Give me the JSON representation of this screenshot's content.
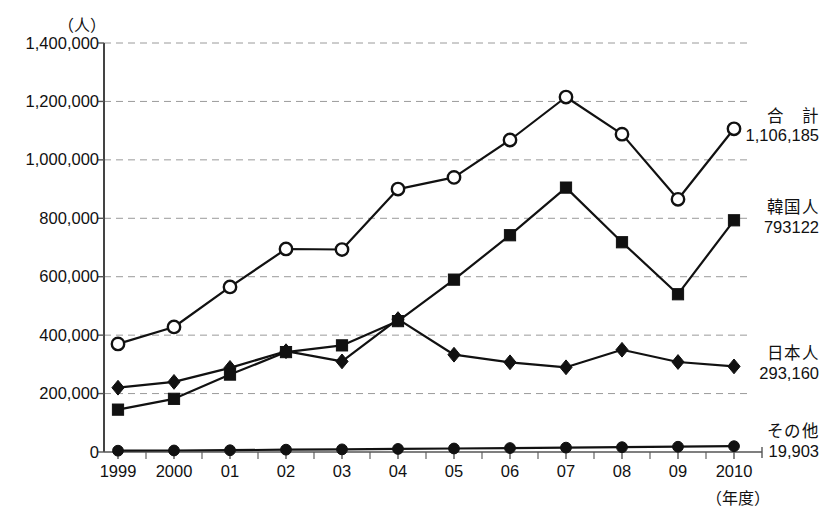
{
  "chart_data": {
    "type": "line",
    "title": "",
    "subtitle": "",
    "xlabel": "（年度）",
    "ylabel": "（人）",
    "ylim": [
      0,
      1400000
    ],
    "ytick_values": [
      0,
      200000,
      400000,
      600000,
      800000,
      1000000,
      1200000,
      1400000
    ],
    "ytick_labels": [
      "0",
      "200,000",
      "400,000",
      "600,000",
      "800,000",
      "1,000,000",
      "1,200,000",
      "1,400,000"
    ],
    "grid": "horizontal-dashed",
    "legend_position": "right-inline-annotations",
    "categories": [
      "1999",
      "2000",
      "01",
      "02",
      "03",
      "04",
      "05",
      "06",
      "07",
      "08",
      "09",
      "2010"
    ],
    "series": [
      {
        "name": "合　計",
        "marker": "open-circle",
        "end_label": "1,106,185",
        "values": [
          370000,
          428000,
          565000,
          695000,
          693000,
          900000,
          940000,
          1068000,
          1215000,
          1088000,
          865000,
          1106185
        ]
      },
      {
        "name": "韓国人",
        "marker": "filled-square",
        "end_label": "793122",
        "values": [
          145000,
          182000,
          265000,
          342000,
          365000,
          448000,
          590000,
          742000,
          905000,
          718000,
          540000,
          793122
        ]
      },
      {
        "name": "日本人",
        "marker": "filled-diamond",
        "end_label": "293,160",
        "values": [
          220000,
          240000,
          288000,
          345000,
          310000,
          455000,
          333000,
          307000,
          290000,
          350000,
          308000,
          293160
        ]
      },
      {
        "name": "その他",
        "marker": "filled-circle",
        "end_label": "19,903",
        "values": [
          4500,
          5200,
          6000,
          8000,
          9000,
          10500,
          12000,
          13500,
          15000,
          16500,
          18000,
          19903
        ]
      }
    ],
    "colors": {
      "line": "#111111",
      "grid": "#9a9a9a",
      "axis": "#555555",
      "text": "#111111",
      "marker_fill_open": "#ffffff"
    }
  },
  "annotations": [
    {
      "name": "合　計",
      "value": "1,106,185"
    },
    {
      "name": "韓国人",
      "value": "793122"
    },
    {
      "name": "日本人",
      "value": "293,160"
    },
    {
      "name": "その他",
      "value": "19,903"
    }
  ]
}
